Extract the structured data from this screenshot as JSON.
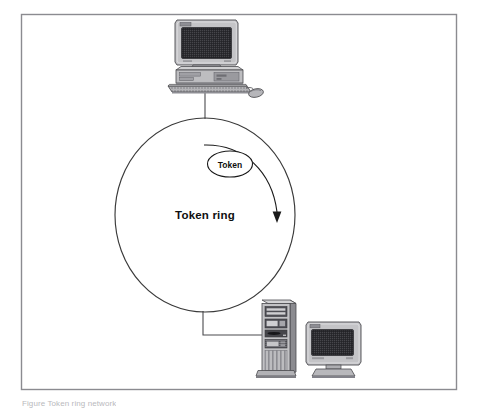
{
  "figure": {
    "kind": "network-topology-diagram",
    "title": "Token ring",
    "frame": {
      "border_color": "#8b8b90",
      "background": "#ffffff",
      "x": 21,
      "y": 14,
      "width": 436,
      "height": 376
    },
    "caption": "Figure    Token ring network"
  },
  "labels": {
    "token": "Token",
    "token_ring": "Token ring"
  },
  "ring": {
    "name": "token-ring-loop",
    "center_x": 205,
    "center_y": 215,
    "radius_x": 90,
    "radius_y": 97,
    "stroke": "#3a3a3a",
    "stroke_width": 1
  },
  "direction_arrow": {
    "name": "clockwise-flow-arrow",
    "direction": "clockwise",
    "arrow_tip_x": 277,
    "arrow_tip_y": 222,
    "stroke": "#1a1a1a"
  },
  "token_bubble": {
    "name": "token-ellipse",
    "center_x": 230,
    "center_y": 164,
    "radius_x": 22,
    "radius_y": 13,
    "stroke": "#1a1a1a",
    "fill": "#ffffff"
  },
  "nodes": [
    {
      "id": "workstation-top",
      "type": "desktop-computer",
      "position": "top",
      "monitor_logo": "oem-badge",
      "has_keyboard": true,
      "has_mouse": true,
      "link_label": "drop-cable-to-ring"
    },
    {
      "id": "server-bottom-right",
      "type": "server-tower",
      "position": "bottom-right",
      "drive_bays": 4,
      "vent_ribs": 7,
      "has_monitor": true,
      "monitor_logo": "oem-badge",
      "link_label": "drop-cable-to-ring"
    }
  ],
  "palette": {
    "case_light": "#c9c9cb",
    "case_mid": "#a8a8aa",
    "case_dark": "#74747a",
    "screen_dark": "#2d2d31",
    "outline": "#4a4a4e",
    "cable": "#4a4a4e",
    "text": "#0f0f0f"
  }
}
